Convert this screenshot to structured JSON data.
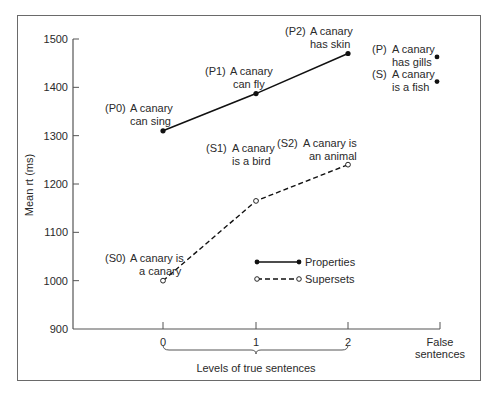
{
  "chart_data": {
    "type": "line",
    "title": "",
    "xlabel": "Levels of true sentences",
    "ylabel": "Mean rt (ms)",
    "ylim": [
      900,
      1500
    ],
    "y_ticks": [
      "1500",
      "1400",
      "1300",
      "1200",
      "1100",
      "1000",
      "900"
    ],
    "x_ticks": [
      "0",
      "1",
      "2"
    ],
    "x_extra_label": [
      "False",
      "sentences"
    ],
    "categories": [
      "0",
      "1",
      "2"
    ],
    "series": [
      {
        "name": "Properties",
        "style": "solid line, filled markers",
        "values": [
          1310,
          1387,
          1470
        ],
        "labels": [
          [
            "(P0)",
            "A canary",
            "can sing"
          ],
          [
            "(P1)",
            "A canary",
            "can fly"
          ],
          [
            "(P2)",
            "A canary",
            "has skin"
          ]
        ]
      },
      {
        "name": "Supersets",
        "style": "dashed line, open markers",
        "values": [
          1000,
          1165,
          1240
        ],
        "labels": [
          [
            "(S0)",
            "A canary is",
            "a canary"
          ],
          [
            "(S1)",
            "A canary",
            "is a bird"
          ],
          [
            "(S2)",
            "A canary is",
            "an animal"
          ]
        ]
      }
    ],
    "false_sentences": [
      {
        "name": "P",
        "label": [
          "(P)",
          "A canary",
          "has gills"
        ],
        "value": 1463
      },
      {
        "name": "S",
        "label": [
          "(S)",
          "A canary",
          "is a fish"
        ],
        "value": 1412
      }
    ],
    "legend": {
      "position": "inside, lower right",
      "entries": [
        "Properties",
        "Supersets"
      ]
    },
    "grid": false
  },
  "colors": {
    "line": "#111111",
    "text": "#2a2a2a",
    "axis": "#555555",
    "frame": "#6a6a6a"
  }
}
